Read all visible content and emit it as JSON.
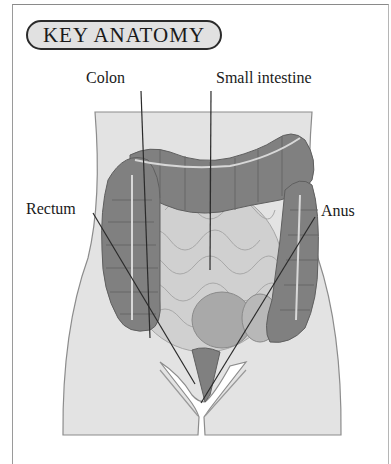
{
  "title": "KEY ANATOMY",
  "labels": {
    "colon": "Colon",
    "small_intestine": "Small intestine",
    "rectum": "Rectum",
    "anus": "Anus"
  },
  "colors": {
    "body_fill": "#e3e3e3",
    "body_stroke": "#8c8c8c",
    "colon_fill": "#7f7f7f",
    "small_intestine_fill": "#cfcfcf",
    "leader_line": "#2a2a2a",
    "badge_fill": "#e1e1e1"
  }
}
